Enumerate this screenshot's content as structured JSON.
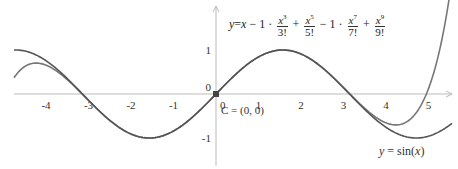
{
  "chart_data": {
    "type": "line",
    "title": "",
    "xlabel": "",
    "ylabel": "",
    "xlim": [
      -5.05,
      5.65
    ],
    "ylim": [
      -1.7,
      2.1
    ],
    "x_ticks": [
      -4,
      -3,
      -2,
      -1,
      0,
      1,
      2,
      3,
      4,
      5
    ],
    "y_ticks": [
      -1,
      0,
      1
    ],
    "grid": false,
    "series": [
      {
        "name": "y = sin(x)",
        "function": "sin",
        "color": "#555555",
        "label_text": "y = sin(x)"
      },
      {
        "name": "Taylor polynomial degree 9",
        "function": "taylor9",
        "coefficients": {
          "x": 1,
          "x^3": -0.16667,
          "x^5": 0.008333,
          "x^7": -0.000198,
          "x^9": 2.7557e-06
        },
        "color": "#777777",
        "label_text": "y = x − 1 · x³/3! + x⁵/5! − 1 · x⁷/7! + x⁹/9!"
      }
    ],
    "points": [
      {
        "name": "C",
        "x": 0,
        "y": 0,
        "label": "C = (0, 0)"
      }
    ]
  },
  "formula": {
    "lhs": "y",
    "eq": "=",
    "x": "x",
    "minus1": "−",
    "one1": "1",
    "dot1": "·",
    "t3_num": "x",
    "t3_exp": "3",
    "t3_den": "3!",
    "plus1": "+",
    "t5_num": "x",
    "t5_exp": "5",
    "t5_den": "5!",
    "minus2": "−",
    "one2": "1",
    "dot2": "·",
    "t7_num": "x",
    "t7_exp": "7",
    "t7_den": "7!",
    "plus2": "+",
    "t9_num": "x",
    "t9_exp": "9",
    "t9_den": "9!"
  },
  "labels": {
    "point": "C = (0, 0)",
    "sin_lhs": "y",
    "sin_rest": " = sin(",
    "sin_x": "x",
    "sin_close": ")",
    "origin_y": "0",
    "origin_x": "0"
  }
}
